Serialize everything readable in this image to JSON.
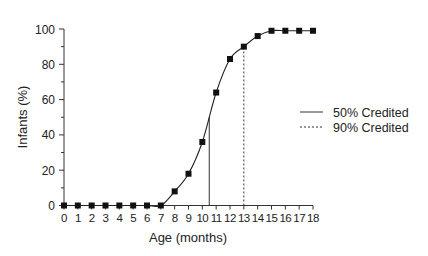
{
  "chart_data": {
    "type": "line",
    "title": "",
    "xlabel": "Age (months)",
    "ylabel": "Infants (%)",
    "x": [
      0,
      1,
      2,
      3,
      4,
      5,
      6,
      7,
      8,
      9,
      10,
      11,
      12,
      13,
      14,
      15,
      16,
      17,
      18
    ],
    "series": [
      {
        "name": "Infants credited",
        "values": [
          0,
          0,
          0,
          0,
          0,
          0,
          0,
          0,
          8,
          18,
          36,
          64,
          83,
          90,
          96,
          99,
          99,
          99,
          99
        ]
      }
    ],
    "reference_lines": [
      {
        "name": "50% Credited",
        "x": 10.5,
        "y": 50,
        "style": "solid"
      },
      {
        "name": "90% Credited",
        "x": 13,
        "y": 90,
        "style": "dashed"
      }
    ],
    "xlim": [
      0,
      18
    ],
    "ylim": [
      0,
      100
    ],
    "yticks": [
      0,
      20,
      40,
      60,
      80,
      100
    ],
    "xticks": [
      0,
      1,
      2,
      3,
      4,
      5,
      6,
      7,
      8,
      9,
      10,
      11,
      12,
      13,
      14,
      15,
      16,
      17,
      18
    ],
    "grid": false,
    "legend_position": "right"
  },
  "legend": {
    "items": [
      {
        "label": "50% Credited",
        "style": "solid"
      },
      {
        "label": "90% Credited",
        "style": "dashed"
      }
    ]
  }
}
